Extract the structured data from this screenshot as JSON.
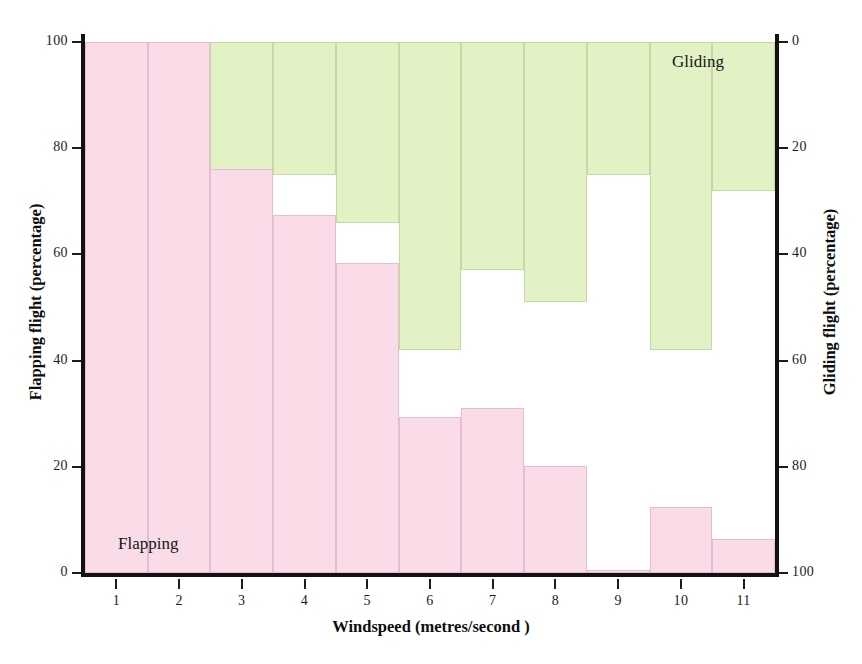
{
  "chart_data": {
    "type": "bar",
    "subtype": "stacked-divergent-histogram",
    "title": "",
    "xlabel": "Windspeed (metres/second )",
    "ylabel_left": "Flapping flight (percentage)",
    "ylabel_right": "Gliding flight (percentage)",
    "xlim": [
      0.5,
      11.5
    ],
    "ylim_left": [
      0,
      100
    ],
    "ylim_right": [
      0,
      100
    ],
    "y_right_inverted": true,
    "grid": false,
    "legend_position": "in-plot",
    "x_tick_labels": [
      "1",
      "2",
      "3",
      "4",
      "5",
      "6",
      "7",
      "8",
      "9",
      "10",
      "11"
    ],
    "y_left_tick_labels": [
      "0",
      "20",
      "40",
      "60",
      "80",
      "100"
    ],
    "y_left_tick_values": [
      0,
      20,
      40,
      60,
      80,
      100
    ],
    "y_right_tick_labels": [
      "0",
      "20",
      "40",
      "60",
      "80",
      "100"
    ],
    "y_right_tick_values": [
      0,
      20,
      40,
      60,
      80,
      100
    ],
    "categories": [
      1,
      2,
      3,
      4,
      5,
      6,
      7,
      8,
      9,
      10,
      11
    ],
    "series": [
      {
        "name": "Flapping",
        "color": "#f9dce8",
        "edge_color": "#e8bcd0",
        "axis": "left",
        "anchor": "bottom",
        "values": [
          100,
          100,
          76,
          67.4,
          58.4,
          29.4,
          31.1,
          20.1,
          0.6,
          12.5,
          6.4
        ]
      },
      {
        "name": "Gliding",
        "color": "#e3f2c5",
        "edge_color": "#c6d9a4",
        "axis": "right",
        "anchor": "top",
        "values": [
          0,
          0,
          25,
          25,
          34,
          58,
          43,
          49,
          25,
          58,
          28
        ],
        "values_as_left_scale_bottom": [
          100,
          100,
          75,
          75,
          66,
          42,
          57,
          51,
          75,
          42,
          72
        ]
      }
    ],
    "annotations": [
      {
        "text": "Flapping",
        "x_frac": 0.048,
        "y_frac": 0.927
      },
      {
        "text": "Gliding",
        "x_frac": 0.851,
        "y_frac": 0.019
      }
    ]
  },
  "colors": {
    "flapping": "#f9dce8",
    "flapping_edge": "#e8bcd0",
    "gliding": "#e3f2c5",
    "gliding_edge": "#c6d9a4",
    "axis": "#121212",
    "background": "#ffffff"
  }
}
